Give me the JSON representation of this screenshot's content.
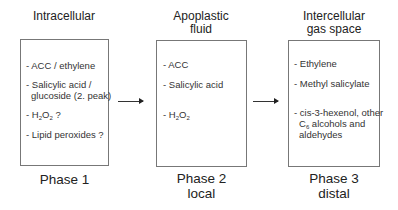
{
  "columns": [
    {
      "heading": [
        "Intracellular"
      ],
      "items": [
        {
          "lines": [
            "- ACC / ethylene"
          ]
        },
        {
          "lines": [
            "- Salicylic acid /",
            "  glucoside (2. peak)"
          ]
        },
        {
          "prefix": "- H",
          "sub1": "2",
          "mid": "O",
          "sub2": "2",
          "suffix": " ?"
        },
        {
          "lines": [
            "- Lipid peroxides ?"
          ]
        }
      ],
      "phase": [
        "Phase 1"
      ]
    },
    {
      "heading": [
        "Apoplastic",
        "fluid"
      ],
      "items": [
        {
          "lines": [
            "- ACC"
          ]
        },
        {
          "lines": [
            "- Salicylic acid"
          ]
        },
        {
          "prefix": "- H",
          "sub1": "2",
          "mid": "O",
          "sub2": "2",
          "suffix": ""
        }
      ],
      "phase": [
        "Phase 2",
        "local"
      ]
    },
    {
      "heading": [
        "Intercellular",
        "gas space"
      ],
      "items": [
        {
          "lines": [
            "- Ethylene"
          ]
        },
        {
          "lines": [
            "- Methyl salicylate"
          ]
        },
        {
          "lines": [
            "- cis-3-hexenol, other"
          ]
        },
        {
          "prefix": "C",
          "sub1": "6",
          "suffix": " alcohols and"
        },
        {
          "lines": [
            "aldehydes"
          ]
        }
      ],
      "phase": [
        "Phase 3",
        "distal"
      ]
    }
  ],
  "arrows": [
    {
      "from": "Intracellular",
      "to": "Apoplastic fluid",
      "icon": "arrow-right-icon"
    },
    {
      "from": "Apoplastic fluid",
      "to": "Intercellular gas space",
      "icon": "arrow-right-icon"
    }
  ]
}
